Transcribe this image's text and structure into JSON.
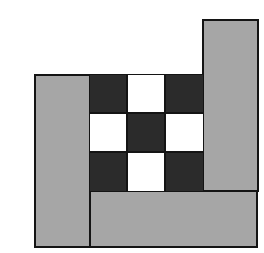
{
  "diagram": {
    "colors": {
      "background": "#ffffff",
      "gray": "#a6a6a6",
      "dark": "#2b2b2b",
      "light": "#ffffff",
      "border": "#141414"
    },
    "strips": [
      {
        "name": "left-strip",
        "x": 34,
        "y": 74,
        "w": 56,
        "h": 174
      },
      {
        "name": "right-strip",
        "x": 202,
        "y": 19,
        "w": 57,
        "h": 173
      },
      {
        "name": "bottom-strip",
        "x": 89,
        "y": 190,
        "w": 169,
        "h": 58
      }
    ],
    "grid": {
      "x": 89,
      "y": 74,
      "cell_w": 38,
      "cell_h": 38.6,
      "pattern": [
        [
          "dark",
          "light",
          "dark"
        ],
        [
          "light",
          "dark",
          "light"
        ],
        [
          "dark",
          "light",
          "dark"
        ]
      ]
    }
  }
}
